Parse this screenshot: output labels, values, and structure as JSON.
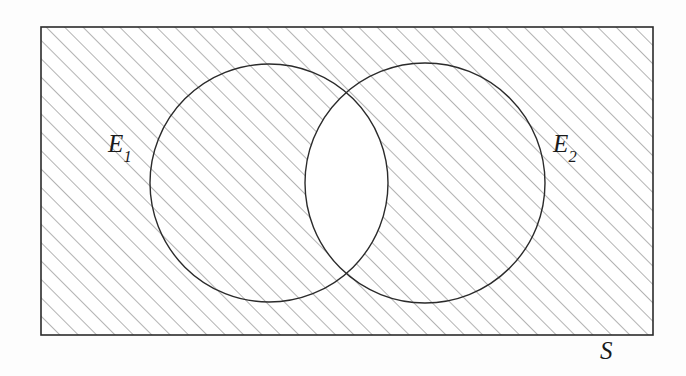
{
  "figure": {
    "type": "venn-diagram",
    "background_color": "#fdfdfd"
  },
  "labels": {
    "event_one": {
      "base": "E",
      "subscript": "1",
      "full": "E1",
      "x": 120,
      "y": 148
    },
    "event_two": {
      "base": "E",
      "subscript": "2",
      "full": "E2",
      "x": 565,
      "y": 148
    },
    "sample_space": {
      "base": "S",
      "subscript": "",
      "full": "S",
      "x": 612,
      "y": 355
    }
  },
  "chart_data": {
    "type": "diagram",
    "diagram_kind": "venn",
    "sets": [
      {
        "name": "E1",
        "label": "E1",
        "shape": "circle",
        "cx": 269,
        "cy": 183,
        "r": 119,
        "fill": "none",
        "stroke": "#2b2b2b",
        "stroke_width": 1.4
      },
      {
        "name": "E2",
        "label": "E2",
        "shape": "circle",
        "cx": 425,
        "cy": 183,
        "r": 120,
        "fill": "none",
        "stroke": "#2b2b2b",
        "stroke_width": 1.4
      }
    ],
    "universe": {
      "name": "S",
      "label": "S",
      "shape": "rectangle",
      "x": 41,
      "y": 27,
      "width": 612,
      "height": 308,
      "fill": "#ffffff",
      "stroke": "#2b2b2b",
      "stroke_width": 1.6
    },
    "shaded_region": {
      "description": "Everything in S except the overlap of E1 and E2",
      "set_expression": "(E1 AND E2) complement",
      "hatch": {
        "angle_degrees": -45,
        "spacing_px": 13,
        "line_width_px": 1,
        "color": "#6e6e6e"
      }
    },
    "unshaded_region": {
      "description": "The lens-shaped intersection of E1 and E2",
      "set_expression": "E1 AND E2",
      "fill": "#ffffff"
    },
    "intersection_points": [
      {
        "x": 342,
        "y": 82
      },
      {
        "x": 342,
        "y": 283
      }
    ],
    "colors": {
      "stroke": "#2b2b2b",
      "hatch": "#6e6e6e",
      "fill": "#ffffff",
      "page": "#fdfdfd"
    }
  }
}
